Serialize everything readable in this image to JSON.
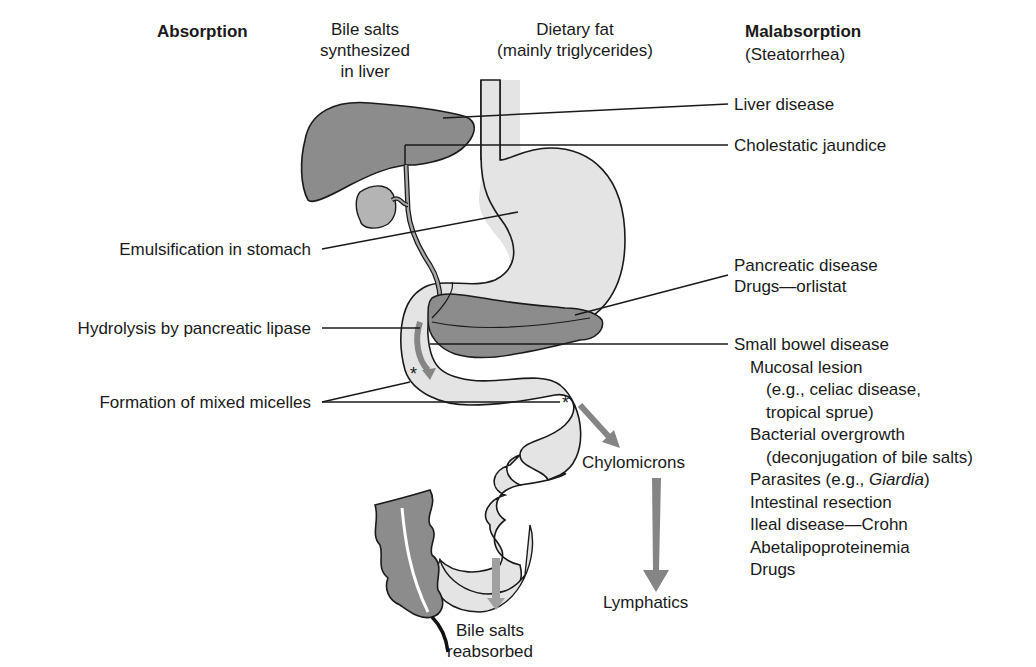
{
  "headers": {
    "absorption": "Absorption",
    "bile_salts_synth": [
      "Bile salts",
      "synthesized",
      "in liver"
    ],
    "dietary_fat": [
      "Dietary fat",
      "(mainly triglycerides)"
    ],
    "malabsorption": "Malabsorption",
    "malabsorption_sub": "(Steatorrhea)"
  },
  "absorption_steps": {
    "emulsification": "Emulsification in stomach",
    "hydrolysis": "Hydrolysis by pancreatic lipase",
    "micelles": "Formation of mixed micelles"
  },
  "flow_labels": {
    "chylomicrons": "Chylomicrons",
    "lymphatics": "Lymphatics",
    "bile_reabsorbed": [
      "Bile salts",
      "reabsorbed"
    ]
  },
  "malabsorption_causes": {
    "liver_disease": "Liver disease",
    "cholestatic": "Cholestatic jaundice",
    "pancreatic": "Pancreatic disease",
    "orlistat": "Drugs—orlistat",
    "small_bowel": "Small bowel disease",
    "mucosal": "Mucosal lesion",
    "mucosal_eg1": "(e.g., celiac disease,",
    "mucosal_eg2": "tropical sprue)",
    "bacterial": "Bacterial overgrowth",
    "bacterial_sub": "(deconjugation of bile salts)",
    "parasites_pre": "Parasites (e.g., ",
    "parasites_italic": "Giardia",
    "parasites_post": ")",
    "resection": "Intestinal resection",
    "ileal": "Ileal disease—Crohn",
    "abeta": "Abetalipoproteinemia",
    "drugs": "Drugs"
  },
  "markers": {
    "star": "*"
  },
  "colors": {
    "organ_dark": "#8c8c8c",
    "gut_light": "#e4e4e4",
    "arrow_gray": "#858585",
    "outline": "#1a1a1a"
  }
}
